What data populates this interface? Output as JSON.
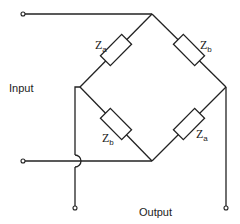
{
  "labels": {
    "input": "Input",
    "output": "Output"
  },
  "components": [
    {
      "id": "top-left",
      "symbol": "Z",
      "subscript": "a"
    },
    {
      "id": "top-right",
      "symbol": "Z",
      "subscript": "b"
    },
    {
      "id": "bottom-left",
      "symbol": "Z",
      "subscript": "b"
    },
    {
      "id": "bottom-right",
      "symbol": "Z",
      "subscript": "a"
    }
  ],
  "colors": {
    "line": "#222222",
    "background": "#ffffff"
  }
}
